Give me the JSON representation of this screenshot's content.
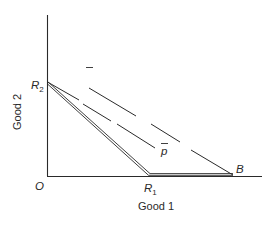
{
  "diagram": {
    "axes": {
      "x_label": "Good 1",
      "y_label": "Good 2",
      "origin_label": "O"
    },
    "points": {
      "R2": {
        "letter": "R",
        "subscript": "2"
      },
      "R1": {
        "letter": "R",
        "subscript": "1"
      },
      "B": {
        "letter": "B"
      }
    },
    "lines": [
      {
        "id": "production-frontier",
        "style": "double",
        "path": [
          "R2",
          "R1",
          "B"
        ]
      },
      {
        "id": "price-line-upper",
        "style": "dashed",
        "label": "p",
        "label_overbar": true,
        "ends_at": "B"
      },
      {
        "id": "price-line-lower",
        "style": "dashed",
        "label": "p",
        "label_overbar": true,
        "starts_at": "R2"
      }
    ],
    "colors": {
      "ink": "#2a2a2a",
      "background": "#ffffff"
    }
  }
}
